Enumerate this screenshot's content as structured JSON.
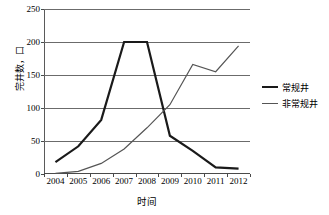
{
  "chart_data": {
    "type": "line",
    "title": "",
    "xlabel": "时间",
    "ylabel": "完井数，口",
    "categories": [
      "2004",
      "2005",
      "2006",
      "2007",
      "2008",
      "2009",
      "2010",
      "2011",
      "2012"
    ],
    "ylim": [
      0,
      250
    ],
    "yticks": [
      0,
      50,
      100,
      150,
      200,
      250
    ],
    "grid": "horizontal",
    "legend_position": "right",
    "series": [
      {
        "name": "常规井",
        "color": "#1a1a1a",
        "width": 2.2,
        "values": [
          18,
          42,
          82,
          200,
          200,
          58,
          35,
          10,
          8
        ]
      },
      {
        "name": "非常规井",
        "color": "#555555",
        "width": 1.2,
        "values": [
          1,
          4,
          16,
          38,
          70,
          105,
          166,
          155,
          194
        ]
      }
    ]
  }
}
